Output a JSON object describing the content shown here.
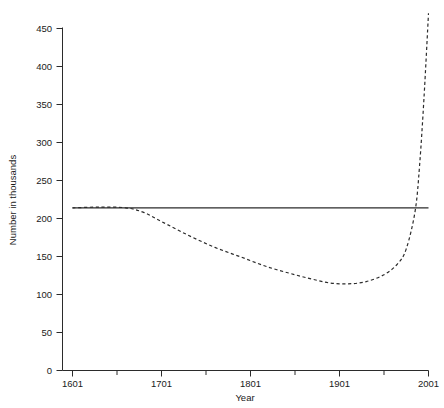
{
  "chart_data": {
    "type": "line",
    "title": "",
    "xlabel": "Year",
    "ylabel": "Number in thousands",
    "xlim": [
      1601,
      2001
    ],
    "ylim": [
      0,
      450
    ],
    "grid": false,
    "legend": null,
    "x_ticks_major": [
      1601,
      1701,
      1801,
      1901,
      2001
    ],
    "x_tick_labels": [
      "1601",
      "1701",
      "1801",
      "1901",
      "2001"
    ],
    "x_ticks_minor": [
      1651,
      1751,
      1851,
      1951
    ],
    "y_ticks": [
      0,
      50,
      100,
      150,
      200,
      250,
      300,
      350,
      400,
      450
    ],
    "y_tick_labels": [
      "0",
      "50",
      "100",
      "150",
      "200",
      "250",
      "300",
      "350",
      "400",
      "450"
    ],
    "series": [
      {
        "name": "constant-reference-line",
        "style": "solid",
        "x": [
          1601,
          2001
        ],
        "values": [
          214,
          214
        ]
      },
      {
        "name": "projected-curve",
        "style": "dashed",
        "x": [
          1601,
          1631,
          1661,
          1681,
          1701,
          1731,
          1761,
          1791,
          1821,
          1851,
          1871,
          1891,
          1911,
          1931,
          1951,
          1966,
          1976,
          1986,
          1991,
          1996,
          2001
        ],
        "values": [
          214,
          215,
          214,
          208,
          196,
          178,
          162,
          149,
          136,
          126,
          120,
          115,
          114,
          117,
          126,
          140,
          160,
          210,
          270,
          360,
          470
        ]
      }
    ]
  },
  "axes": {
    "x_axis_name": "year-axis",
    "y_axis_name": "number-axis"
  }
}
